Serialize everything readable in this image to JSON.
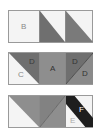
{
  "diagram": {
    "colors": {
      "light": "#f4f4f4",
      "medium": "#8e8e8e",
      "dark": "#6f6f6f",
      "black": "#1e1e1e",
      "border": "#9a9a9a"
    },
    "rows": [
      {
        "cells": [
          {
            "label": "B"
          },
          {
            "label": ""
          },
          {
            "label": ""
          }
        ]
      },
      {
        "cells": [
          {
            "labels": [
              "C",
              "D"
            ]
          },
          {
            "label": "A"
          },
          {
            "labels": [
              "D",
              "D"
            ]
          }
        ]
      },
      {
        "cells": [
          {
            "label": ""
          },
          {
            "label": ""
          },
          {
            "labels": [
              "F",
              "E"
            ]
          }
        ]
      }
    ]
  }
}
